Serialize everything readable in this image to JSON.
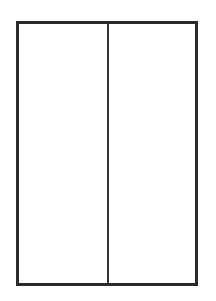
{
  "diagram": {
    "type": "two-panel-rectangle",
    "frame": {
      "border_color": "#2a2a2a",
      "fill_color": "#ffffff"
    },
    "divider": {
      "orientation": "vertical",
      "color": "#333333"
    },
    "panels": [
      {
        "id": "left",
        "label": ""
      },
      {
        "id": "right",
        "label": ""
      }
    ]
  }
}
